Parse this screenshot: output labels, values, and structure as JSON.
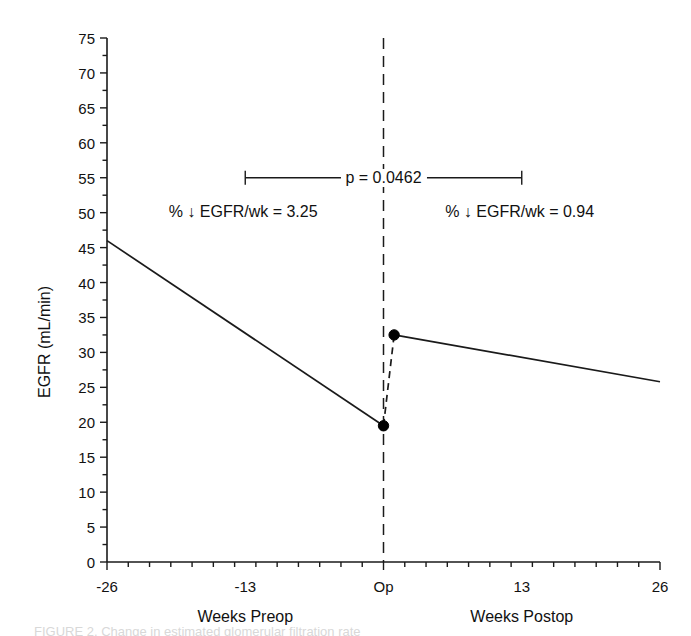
{
  "chart_data": {
    "type": "line",
    "title": "",
    "xlabel": "",
    "ylabel": "EGFR (mL/min)",
    "xlim": [
      -26,
      26
    ],
    "ylim": [
      0,
      75
    ],
    "grid": false,
    "legend_position": "none",
    "y_ticks": [
      0,
      5,
      10,
      15,
      20,
      25,
      30,
      35,
      40,
      45,
      50,
      55,
      60,
      65,
      70,
      75
    ],
    "y_tick_labels": [
      "0",
      "5",
      "10",
      "15",
      "20",
      "25",
      "30",
      "35",
      "40",
      "45",
      "50",
      "55",
      "60",
      "65",
      "70",
      "75"
    ],
    "y_minor_tick_step": 2.5,
    "x_ticks": [
      -26,
      -13,
      0,
      13,
      26
    ],
    "x_tick_labels": [
      "-26",
      "-13",
      "Op",
      "13",
      "26"
    ],
    "x_minor_tick_step": 2,
    "axis_group_labels": [
      {
        "text": "Weeks Preop",
        "x": -13
      },
      {
        "text": "Weeks Postop",
        "x": 13
      }
    ],
    "series": [
      {
        "name": "Preoperative EGFR slope",
        "style": "solid",
        "x": [
          -26,
          0
        ],
        "values": [
          46.0,
          19.5
        ]
      },
      {
        "name": "Perioperative change",
        "style": "dashed",
        "x": [
          0,
          1
        ],
        "values": [
          19.5,
          32.5
        ]
      },
      {
        "name": "Postoperative EGFR slope",
        "style": "solid",
        "x": [
          1,
          26
        ],
        "values": [
          32.5,
          25.8
        ]
      }
    ],
    "markers": [
      {
        "name": "preop-endpoint",
        "x": 0,
        "y": 19.5
      },
      {
        "name": "postop-startpoint",
        "x": 1,
        "y": 32.5
      }
    ],
    "reference_line": {
      "name": "operation-line",
      "x": 0,
      "style": "dashed",
      "y_from": 0,
      "y_to": 75
    },
    "annotations": [
      {
        "name": "preop-rate",
        "text": "% ↓ EGFR/wk = 3.25",
        "x": -13.2,
        "y": 50.0
      },
      {
        "name": "postop-rate",
        "text": "% ↓ EGFR/wk = 0.94",
        "x": 12.8,
        "y": 50.0
      }
    ],
    "significance_bracket": {
      "name": "p-value-bracket",
      "label": "p = 0.0462",
      "p_value": 0.0462,
      "x_from": -13,
      "x_to": 13,
      "y": 55.0
    },
    "colors": {
      "line": "#1a1a1a",
      "marker": "#000000",
      "axis": "#1a1a1a",
      "text": "#111111",
      "background": "#ffffff"
    }
  },
  "caption": {
    "partial_text": "FIGURE 2. Change in estimated glomerular filtration rate"
  }
}
